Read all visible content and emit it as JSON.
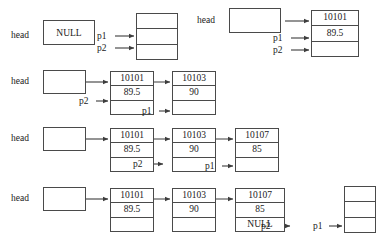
{
  "figure": {
    "background_color": "#ffffff",
    "line_color": "#3d3d3d",
    "text_color": "#1a1a1a"
  },
  "labels": {
    "head": "head",
    "p1": "p1",
    "p2": "p2",
    "null": "NULL",
    "empty": ""
  },
  "values": {
    "id1": "10101",
    "score1": "89.5",
    "id2": "10103",
    "score2": "90",
    "id3": "10107",
    "score3": "85",
    "null": "NULL"
  },
  "steps": [
    {
      "step": 1,
      "head_label": "head",
      "head_value": "NULL",
      "nodes": [
        {
          "name": "new-node",
          "cells": [
            "",
            "",
            ""
          ]
        }
      ],
      "pointers": [
        {
          "label": "p1",
          "target": "new-node"
        },
        {
          "label": "p2",
          "target": "new-node"
        }
      ]
    },
    {
      "step": 2,
      "head_label": "head",
      "head_value": "",
      "nodes": [
        {
          "name": "node-1",
          "cells": [
            "10101",
            "89.5",
            ""
          ]
        }
      ],
      "pointers": [
        {
          "label": "p1",
          "target": "node-1"
        },
        {
          "label": "p2",
          "target": "node-1"
        }
      ]
    },
    {
      "step": 3,
      "head_label": "head",
      "head_value": "",
      "nodes": [
        {
          "name": "node-1",
          "cells": [
            "10101",
            "89.5",
            ""
          ]
        },
        {
          "name": "node-2",
          "cells": [
            "10103",
            "90",
            ""
          ]
        }
      ],
      "pointers": [
        {
          "label": "p2",
          "target": "node-1"
        },
        {
          "label": "p1",
          "target": "node-2"
        }
      ]
    },
    {
      "step": 4,
      "head_label": "head",
      "head_value": "",
      "nodes": [
        {
          "name": "node-1",
          "cells": [
            "10101",
            "89.5",
            ""
          ]
        },
        {
          "name": "node-2",
          "cells": [
            "10103",
            "90",
            ""
          ]
        },
        {
          "name": "node-3",
          "cells": [
            "10107",
            "85",
            ""
          ]
        }
      ],
      "pointers": [
        {
          "label": "p2",
          "target": "node-2"
        },
        {
          "label": "p1",
          "target": "node-3"
        }
      ]
    },
    {
      "step": 5,
      "head_label": "head",
      "head_value": "",
      "nodes": [
        {
          "name": "node-1",
          "cells": [
            "10101",
            "89.5",
            ""
          ]
        },
        {
          "name": "node-2",
          "cells": [
            "10103",
            "90",
            ""
          ]
        },
        {
          "name": "node-3",
          "cells": [
            "10107",
            "85",
            "NULL"
          ]
        },
        {
          "name": "new-node",
          "cells": [
            "",
            "",
            ""
          ]
        }
      ],
      "pointers": [
        {
          "label": "p2",
          "target": "node-3"
        },
        {
          "label": "p1",
          "target": "new-node"
        }
      ]
    }
  ]
}
